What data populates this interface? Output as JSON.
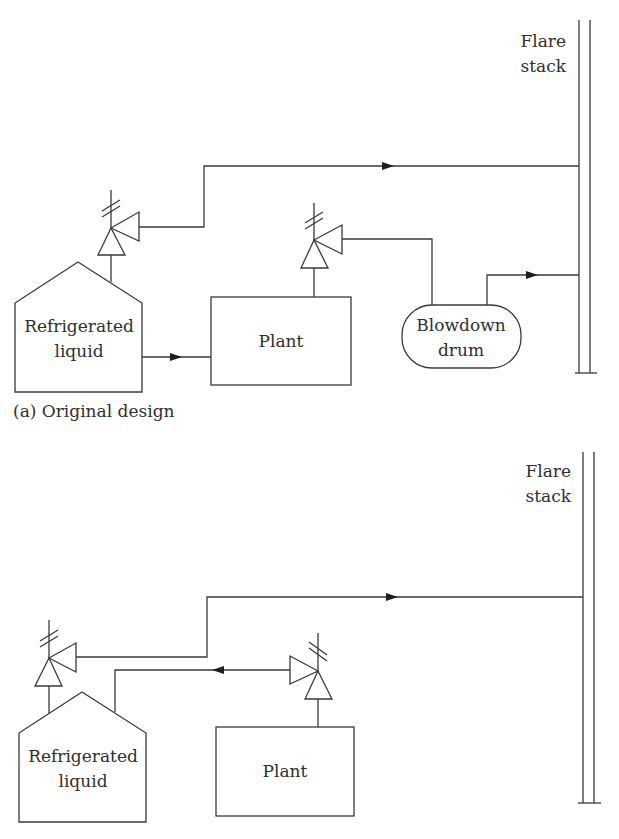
{
  "figure": {
    "panel_a": {
      "caption": "(a) Original design",
      "flare_stack": {
        "line1": "Flare",
        "line2": "stack"
      },
      "tank": {
        "line1": "Refrigerated",
        "line2": "liquid"
      },
      "plant": "Plant",
      "blowdown_drum": {
        "line1": "Blowdown",
        "line2": "drum"
      }
    },
    "panel_b": {
      "flare_stack": {
        "line1": "Flare",
        "line2": "stack"
      },
      "tank": {
        "line1": "Refrigerated",
        "line2": "liquid"
      },
      "plant": "Plant"
    },
    "clipped_caption_visible": false
  }
}
